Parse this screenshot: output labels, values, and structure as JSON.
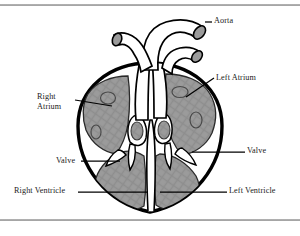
{
  "figure": {
    "type": "anatomical-diagram",
    "view": "coronal cross-section",
    "style": "black-and-white line drawing with gray shaded chambers",
    "colors": {
      "background": "#ffffff",
      "outline": "#000000",
      "chamber_fill": "#9a9a9a",
      "vessel_fill": "#ffffff",
      "vessel_cap_fill": "#9a9a9a",
      "rule": "#8f8f8f",
      "label_text": "#1a1a1a"
    }
  },
  "rules": {
    "top_label": "top-horizontal-rule",
    "bottom_label": "bottom-horizontal-rule"
  },
  "labels": [
    {
      "id": "aorta",
      "text": "Aorta",
      "side": "right"
    },
    {
      "id": "left-atrium",
      "text": "Left Atrium",
      "side": "right"
    },
    {
      "id": "right-atrium",
      "text": "Right\nAtrium",
      "line1": "Right",
      "line2": "Atrium",
      "side": "left"
    },
    {
      "id": "valve-left",
      "text": "Valve",
      "side": "left"
    },
    {
      "id": "valve-right",
      "text": "Valve",
      "side": "right"
    },
    {
      "id": "right-ventricle",
      "text": "Right Ventricle",
      "side": "left"
    },
    {
      "id": "left-ventricle",
      "text": "Left Ventricle",
      "side": "right"
    }
  ],
  "label_text": {
    "aorta": "Aorta",
    "left_atrium": "Left Atrium",
    "right_atrium_line1": "Right",
    "right_atrium_line2": "Atrium",
    "valve_left": "Valve",
    "valve_right": "Valve",
    "right_ventricle": "Right Ventricle",
    "left_ventricle": "Left Ventricle"
  },
  "structures": [
    {
      "name": "aorta",
      "kind": "great-vessel"
    },
    {
      "name": "pulmonary-artery",
      "kind": "great-vessel"
    },
    {
      "name": "vena-cava",
      "kind": "great-vessel"
    },
    {
      "name": "right-atrium",
      "kind": "chamber"
    },
    {
      "name": "left-atrium",
      "kind": "chamber"
    },
    {
      "name": "right-ventricle",
      "kind": "chamber"
    },
    {
      "name": "left-ventricle",
      "kind": "chamber"
    },
    {
      "name": "tricuspid-valve",
      "kind": "valve"
    },
    {
      "name": "mitral-valve",
      "kind": "valve"
    },
    {
      "name": "septum",
      "kind": "wall"
    }
  ]
}
